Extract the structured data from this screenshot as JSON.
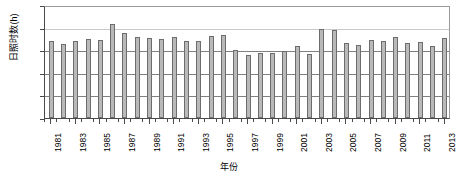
{
  "chart_data": {
    "type": "bar",
    "title": "",
    "xlabel": "年份",
    "ylabel": "日照时数(h)",
    "ylim": [
      0,
      2500
    ],
    "ytick_values": [
      0,
      500,
      1000,
      1500,
      2000,
      2500
    ],
    "ytick_labels": [
      "0",
      "500",
      "1000",
      "1500",
      "2000",
      "2500"
    ],
    "grid": true,
    "legend": "none",
    "xtick_labels": [
      "1981",
      "1983",
      "1985",
      "1987",
      "1989",
      "1991",
      "1993",
      "1995",
      "1997",
      "1999",
      "2001",
      "2003",
      "2005",
      "2007",
      "2009",
      "2011",
      "2013"
    ],
    "categories": [
      "1981",
      "1982",
      "1983",
      "1984",
      "1985",
      "1986",
      "1987",
      "1988",
      "1989",
      "1990",
      "1991",
      "1992",
      "1993",
      "1994",
      "1995",
      "1996",
      "1997",
      "1998",
      "1999",
      "2000",
      "2001",
      "2002",
      "2003",
      "2004",
      "2005",
      "2006",
      "2007",
      "2008",
      "2009",
      "2010",
      "2011",
      "2012",
      "2013"
    ],
    "values": [
      1700,
      1630,
      1710,
      1750,
      1715,
      2085,
      1870,
      1800,
      1760,
      1750,
      1790,
      1710,
      1700,
      1825,
      1835,
      1500,
      1400,
      1430,
      1440,
      1490,
      1600,
      1420,
      1965,
      1950,
      1660,
      1620,
      1715,
      1710,
      1790,
      1660,
      1675,
      1600,
      1780
    ],
    "bar_color": "#b9b9b9",
    "bar_border_color": "#6d6d6d",
    "axis_color": "#4a4a4a",
    "grid_color": "#808080"
  }
}
